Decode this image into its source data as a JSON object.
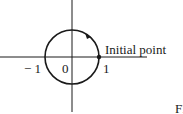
{
  "diagram": {
    "type": "unit-circle",
    "center": [
      72,
      57
    ],
    "radius": 27,
    "axes": {
      "x_range": [
        0,
        147
      ],
      "y_range": [
        0,
        112
      ]
    },
    "labels": {
      "neg_one": "− 1",
      "zero": "0",
      "one": "1",
      "initial_point": "Initial point",
      "figure_fragment": "FI"
    },
    "initial_point_marker": [
      99,
      57
    ],
    "direction": "counterclockwise",
    "colors": {
      "stroke": "#1a1a1a",
      "background": "#ffffff"
    }
  }
}
